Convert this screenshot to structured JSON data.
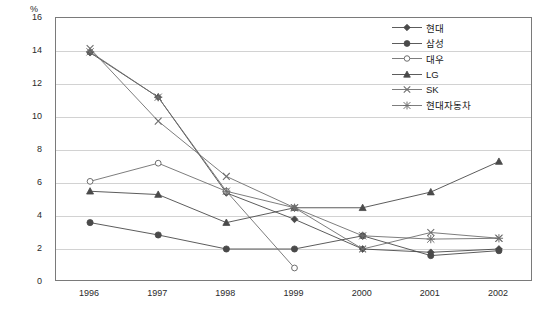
{
  "title_strip": "",
  "axis": {
    "y_unit": "%",
    "y_ticks": [
      "0",
      "2",
      "4",
      "6",
      "8",
      "10",
      "12",
      "14",
      "16"
    ],
    "x_ticks": [
      "1996",
      "1997",
      "1998",
      "1999",
      "2000",
      "2001",
      "2002"
    ]
  },
  "legend": {
    "items": [
      {
        "label": "현대",
        "marker": "diamond-marker",
        "color": "#4a4a4a"
      },
      {
        "label": "삼성",
        "marker": "circle-filled-marker",
        "color": "#4a4a4a"
      },
      {
        "label": "대우",
        "marker": "circle-open-marker",
        "color": "#6e6e6e"
      },
      {
        "label": "LG",
        "marker": "triangle-marker",
        "color": "#4a4a4a"
      },
      {
        "label": "SK",
        "marker": "cross-x-marker",
        "color": "#6e6e6e"
      },
      {
        "label": "현대자동차",
        "marker": "asterisk-marker",
        "color": "#6e6e6e"
      }
    ]
  },
  "chart_data": {
    "type": "line",
    "title": "",
    "xlabel": "",
    "ylabel": "%",
    "ylim": [
      0,
      16
    ],
    "ytick_step": 2,
    "grid": true,
    "legend_position": "top-right-inside",
    "categories": [
      "1996",
      "1997",
      "1998",
      "1999",
      "2000",
      "2001",
      "2002"
    ],
    "series": [
      {
        "name": "현대",
        "marker": "diamond",
        "values": [
          13.9,
          11.2,
          5.4,
          3.8,
          2.0,
          1.8,
          2.0
        ]
      },
      {
        "name": "삼성",
        "marker": "circle-filled",
        "values": [
          3.6,
          2.85,
          2.0,
          2.0,
          2.8,
          1.6,
          1.9
        ]
      },
      {
        "name": "대우",
        "marker": "circle-open",
        "values": [
          6.1,
          7.2,
          5.5,
          0.85,
          null,
          null,
          null
        ]
      },
      {
        "name": "LG",
        "marker": "triangle",
        "values": [
          5.5,
          5.3,
          3.6,
          4.5,
          4.5,
          5.45,
          7.3
        ]
      },
      {
        "name": "SK",
        "marker": "cross-x",
        "values": [
          14.15,
          9.75,
          6.4,
          4.5,
          2.0,
          3.0,
          2.65
        ]
      },
      {
        "name": "현대자동차",
        "marker": "asterisk",
        "values": [
          13.95,
          11.2,
          5.5,
          4.5,
          2.8,
          2.6,
          2.65
        ]
      }
    ]
  }
}
